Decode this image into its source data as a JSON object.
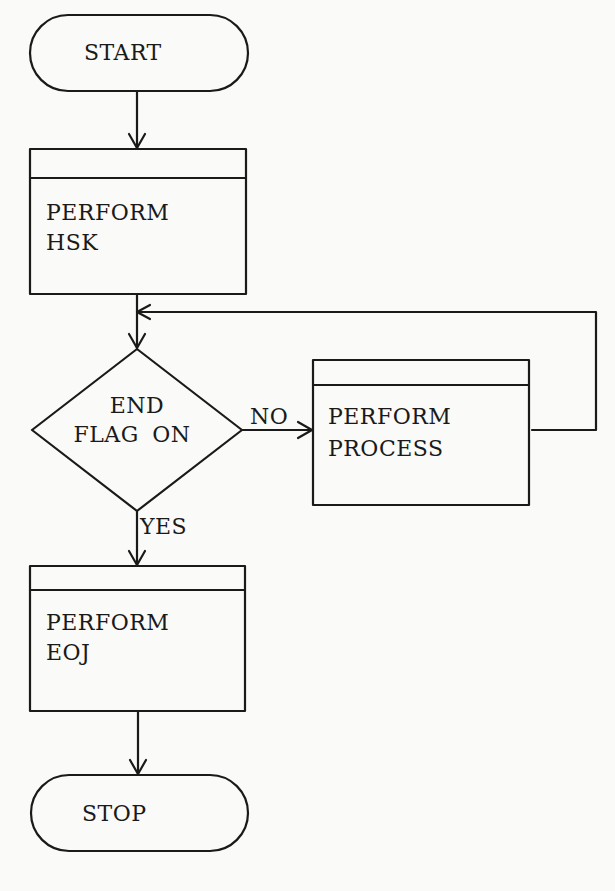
{
  "colors": {
    "background": "#fafaf8",
    "stroke": "#1a1a1a"
  },
  "nodes": {
    "start": {
      "type": "terminator",
      "label": "START"
    },
    "hsk": {
      "type": "predefined-process",
      "line1": "PERFORM",
      "line2": "HSK"
    },
    "decision": {
      "type": "decision",
      "line1": "END",
      "line2": "FLAG ON"
    },
    "process": {
      "type": "predefined-process",
      "line1": "PERFORM",
      "line2": "PROCESS"
    },
    "eoj": {
      "type": "predefined-process",
      "line1": "PERFORM",
      "line2": "EOJ"
    },
    "stop": {
      "type": "terminator",
      "label": "STOP"
    }
  },
  "edges": {
    "no_label": "NO",
    "yes_label": "YES"
  }
}
